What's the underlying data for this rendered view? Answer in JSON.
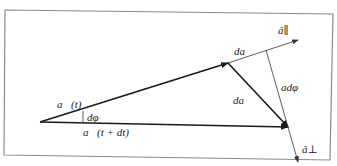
{
  "diagram": {
    "title": "",
    "colors": {
      "frame": "#8a8a8a",
      "vector": "#1a1a1a",
      "thin": "#444444",
      "background": "#ffffff"
    },
    "frame": {
      "points": [
        [
          5,
          10
        ],
        [
          333,
          14
        ],
        [
          330,
          160
        ],
        [
          4,
          155
        ]
      ]
    },
    "points": {
      "origin": [
        40,
        122
      ],
      "a_t_tip": [
        228,
        63
      ],
      "a_tdt_tip": [
        288,
        127
      ],
      "a_par_tip": [
        298,
        40
      ],
      "perp_start": [
        266,
        50
      ],
      "a_perp_tip": [
        298,
        162
      ],
      "dphi_marker": [
        [
          83,
          111
        ],
        [
          83,
          123
        ]
      ]
    },
    "labels": {
      "a_t": "a⃗(t)",
      "a_t_dt": "a⃗(t + dt)",
      "dphi": "dφ",
      "da": "da",
      "da_vec": "da⃗",
      "a_dphi": "adφ",
      "a_parallel": "â∥",
      "a_perp": "â⊥"
    },
    "label_positions": {
      "a_t": [
        57,
        99
      ],
      "a_t_dt": [
        83,
        127
      ],
      "dphi": [
        87,
        112
      ],
      "da": [
        234,
        46
      ],
      "da_vec": [
        233,
        95
      ],
      "a_dphi": [
        281,
        82
      ],
      "a_parallel": [
        278,
        25
      ],
      "a_perp": [
        302,
        144
      ]
    }
  }
}
